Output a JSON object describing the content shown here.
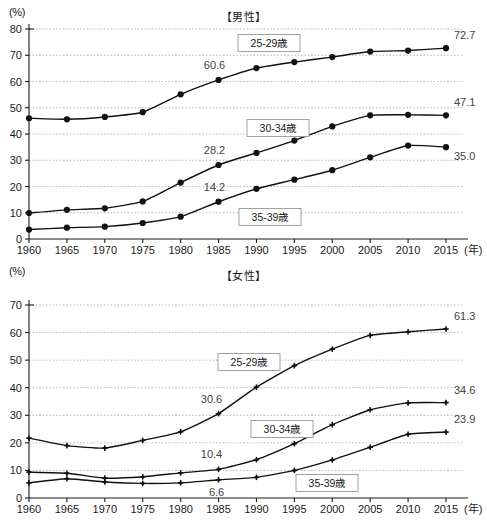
{
  "figure": {
    "unit_label": "(%)",
    "x_axis_suffix": "(年)"
  },
  "charts": [
    {
      "id": "male",
      "title": "【男性】",
      "unit_label": "(%)",
      "type": "line",
      "xlabel": "(年)",
      "ylabel": "(%)",
      "ylim": [
        0,
        80
      ],
      "yticks": [
        "0",
        "10",
        "20",
        "30",
        "40",
        "50",
        "60",
        "70",
        "80"
      ],
      "ytick_values": [
        0,
        10,
        20,
        30,
        40,
        50,
        60,
        70,
        80
      ],
      "grid": true,
      "x": [
        1960,
        1965,
        1970,
        1975,
        1980,
        1985,
        1990,
        1995,
        2000,
        2005,
        2010,
        2015
      ],
      "xticks": [
        "1960",
        "1965",
        "1970",
        "1975",
        "1980",
        "1985",
        "1990",
        "1995",
        "2000",
        "2005",
        "2010",
        "2015"
      ],
      "marker": "filled-circle",
      "series": [
        {
          "name": "25-29歳",
          "legend_label": "25-29歳",
          "values": [
            46.0,
            45.6,
            46.5,
            48.3,
            55.1,
            60.6,
            65.1,
            67.4,
            69.3,
            71.4,
            71.8,
            72.7
          ],
          "end_value_label": "72.7",
          "annotation": {
            "label": "60.6",
            "year": 1985
          }
        },
        {
          "name": "30-34歳",
          "legend_label": "30-34歳",
          "values": [
            9.9,
            11.1,
            11.7,
            14.3,
            21.5,
            28.2,
            32.8,
            37.5,
            42.9,
            47.1,
            47.3,
            47.1
          ],
          "end_value_label": "47.1",
          "annotation": {
            "label": "28.2",
            "year": 1985
          }
        },
        {
          "name": "35-39歳",
          "legend_label": "35-39歳",
          "values": [
            3.6,
            4.3,
            4.7,
            6.1,
            8.5,
            14.2,
            19.1,
            22.6,
            26.2,
            31.1,
            35.6,
            35.0
          ],
          "end_value_label": "35.0",
          "annotation": {
            "label": "14.2",
            "year": 1985
          }
        }
      ]
    },
    {
      "id": "female",
      "title": "【女性】",
      "unit_label": "(%)",
      "type": "line",
      "xlabel": "(年)",
      "ylabel": "(%)",
      "ylim": [
        0,
        70
      ],
      "yticks": [
        "0",
        "10",
        "20",
        "30",
        "40",
        "50",
        "60",
        "70"
      ],
      "ytick_values": [
        0,
        10,
        20,
        30,
        40,
        50,
        60,
        70
      ],
      "grid": true,
      "x": [
        1960,
        1965,
        1970,
        1975,
        1980,
        1985,
        1990,
        1995,
        2000,
        2005,
        2010,
        2015
      ],
      "xticks": [
        "1960",
        "1965",
        "1970",
        "1975",
        "1980",
        "1985",
        "1990",
        "1995",
        "2000",
        "2005",
        "2010",
        "2015"
      ],
      "marker": "cross",
      "series": [
        {
          "name": "25-29歳",
          "legend_label": "25-29歳",
          "values": [
            21.7,
            19.0,
            18.1,
            20.9,
            24.0,
            30.6,
            40.2,
            48.0,
            54.0,
            59.0,
            60.3,
            61.3
          ],
          "end_value_label": "61.3",
          "annotation": {
            "label": "30.6",
            "year": 1985
          }
        },
        {
          "name": "30-34歳",
          "legend_label": "30-34歳",
          "values": [
            9.4,
            9.0,
            7.2,
            7.7,
            9.1,
            10.4,
            13.9,
            19.7,
            26.6,
            32.0,
            34.5,
            34.6
          ],
          "end_value_label": "34.6",
          "annotation": {
            "label": "10.4",
            "year": 1985
          }
        },
        {
          "name": "35-39歳",
          "legend_label": "35-39歳",
          "values": [
            5.5,
            7.0,
            5.8,
            5.3,
            5.5,
            6.6,
            7.5,
            10.0,
            13.8,
            18.4,
            23.1,
            23.9
          ],
          "end_value_label": "23.9",
          "annotation": {
            "label": "6.6",
            "year": 1985
          }
        }
      ]
    }
  ]
}
